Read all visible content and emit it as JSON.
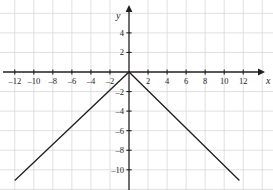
{
  "chart_data": {
    "type": "line",
    "title": "",
    "xlabel": "x",
    "ylabel": "y",
    "xlim": [
      -13.5,
      13.6
    ],
    "ylim": [
      -11.8,
      7.3
    ],
    "grid": true,
    "grid_step": 2,
    "legend": "none",
    "xticks": [
      -12,
      -10,
      -8,
      -6,
      -4,
      -2,
      2,
      4,
      6,
      8,
      10,
      12
    ],
    "xtick_labels": [
      "–12",
      "–10",
      "–8",
      "–6",
      "–4",
      "–2",
      "2",
      "4",
      "6",
      "8",
      "10",
      "12"
    ],
    "yticks": [
      4,
      2,
      -2,
      -4,
      -6,
      -8,
      -10
    ],
    "ytick_labels": [
      "4",
      "2",
      "–2",
      "–4",
      "–6",
      "–8",
      "–10"
    ],
    "series": [
      {
        "name": "y = -|x|",
        "color": "#231f20",
        "x": [
          -12.0,
          0,
          11.6
        ],
        "values": [
          -11.1,
          0,
          -11.1
        ]
      }
    ],
    "annotations": [
      {
        "text": "vertex",
        "x": 0,
        "y": 0
      }
    ]
  },
  "axes": {
    "x_axis_label": "x",
    "y_axis_label": "y",
    "axis_color": "#231f20",
    "grid_color": "#d8d8d8"
  }
}
